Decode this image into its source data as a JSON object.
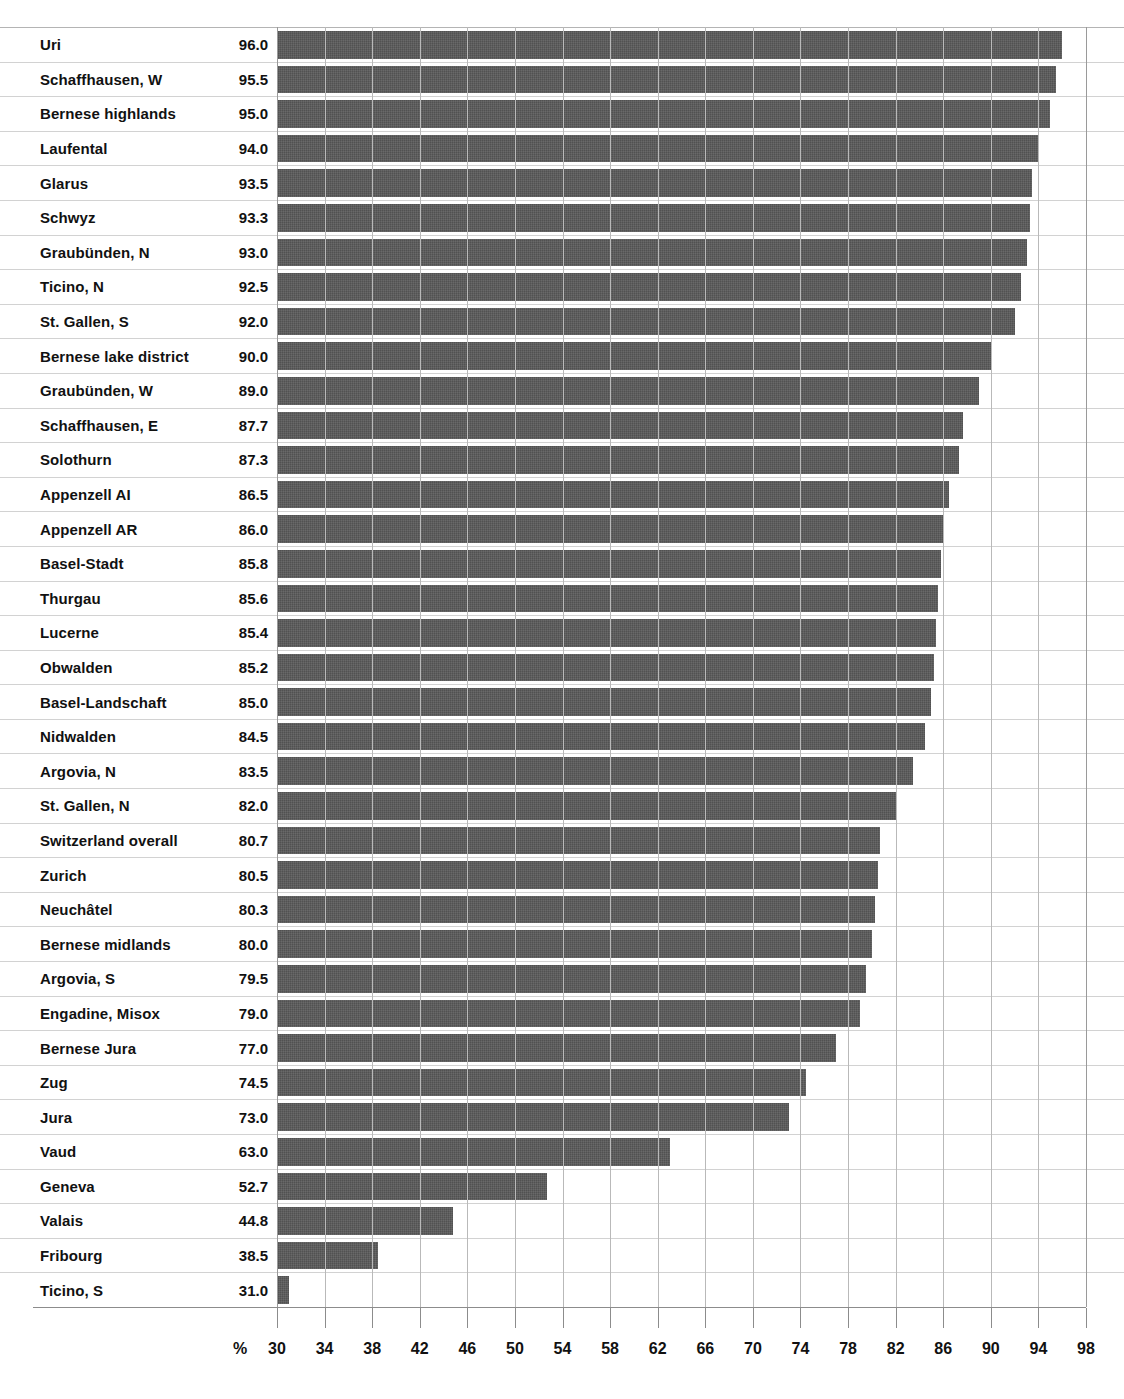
{
  "chart_data": {
    "type": "bar",
    "orientation": "horizontal",
    "title": "",
    "xlabel": "%",
    "ylabel": "",
    "xlim": [
      30,
      98
    ],
    "xticks": [
      30,
      34,
      38,
      42,
      46,
      50,
      54,
      58,
      62,
      66,
      70,
      74,
      78,
      82,
      86,
      90,
      94,
      98
    ],
    "grid": true,
    "legend": null,
    "bar_color": "#5a5a5a",
    "value_label_format": "one-decimal",
    "categories": [
      "Uri",
      "Schaffhausen, W",
      "Bernese highlands",
      "Laufental",
      "Glarus",
      "Schwyz",
      "Graubünden, N",
      "Ticino, N",
      "St. Gallen, S",
      "Bernese lake district",
      "Graubünden, W",
      "Schaffhausen, E",
      "Solothurn",
      "Appenzell AI",
      "Appenzell AR",
      "Basel-Stadt",
      "Thurgau",
      "Lucerne",
      "Obwalden",
      "Basel-Landschaft",
      "Nidwalden",
      "Argovia, N",
      "St. Gallen, N",
      "Switzerland overall",
      "Zurich",
      "Neuchâtel",
      "Bernese midlands",
      "Argovia, S",
      "Engadine, Misox",
      "Bernese Jura",
      "Zug",
      "Jura",
      "Vaud",
      "Geneva",
      "Valais",
      "Fribourg",
      "Ticino, S"
    ],
    "values": [
      96.0,
      95.5,
      95.0,
      94.0,
      93.5,
      93.3,
      93.0,
      92.5,
      92.0,
      90.0,
      89.0,
      87.7,
      87.3,
      86.5,
      86.0,
      85.8,
      85.6,
      85.4,
      85.2,
      85.0,
      84.5,
      83.5,
      82.0,
      80.7,
      80.5,
      80.3,
      80.0,
      79.5,
      79.0,
      77.0,
      74.5,
      73.0,
      63.0,
      52.7,
      44.8,
      38.5,
      31.0
    ],
    "value_labels": [
      "96.0",
      "95.5",
      "95.0",
      "94.0",
      "93.5",
      "93.3",
      "93.0",
      "92.5",
      "92.0",
      "90.0",
      "89.0",
      "87.7",
      "87.3",
      "86.5",
      "86.0",
      "85.8",
      "85.6",
      "85.4",
      "85.2",
      "85.0",
      "84.5",
      "83.5",
      "82.0",
      "80.7",
      "80.5",
      "80.3",
      "80.0",
      "79.5",
      "79.0",
      "77.0",
      "74.5",
      "73.0",
      "63.0",
      "52.7",
      "44.8",
      "38.5",
      "31.0"
    ],
    "xtick_labels": [
      "30",
      "34",
      "38",
      "42",
      "46",
      "50",
      "54",
      "58",
      "62",
      "66",
      "70",
      "74",
      "78",
      "82",
      "86",
      "90",
      "94",
      "98"
    ]
  }
}
